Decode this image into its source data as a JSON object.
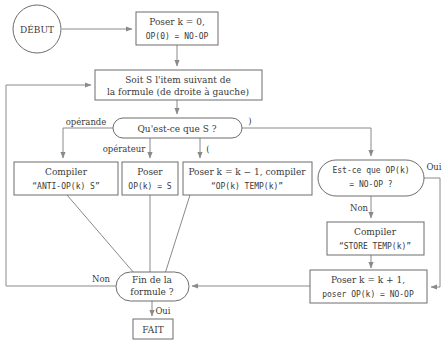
{
  "diagram": {
    "language": "fr",
    "colors": {
      "background": "#ffffff",
      "stroke": "#6d6d6d",
      "edge": "#8a8a8a",
      "text": "#3a3a3a"
    },
    "nodes": {
      "start": {
        "label": "DÉBUT",
        "shape": "circle"
      },
      "init": {
        "line1": "Poser k = 0,",
        "line2": "OP(0) = NO-OP",
        "shape": "rect"
      },
      "next_item": {
        "line1": "Soit S l'item suivant de",
        "line2": "la formule (de droite à gauche)",
        "shape": "rect"
      },
      "what_is_s": {
        "label": "Qu'est-ce que S ?",
        "shape": "stadium"
      },
      "compile_anti": {
        "line1": "Compiler",
        "line2": "“ANTI-OP(k)  S”",
        "shape": "rect"
      },
      "set_op": {
        "line1": "Poser",
        "line2": "OP(k) = S",
        "shape": "rect"
      },
      "dec_k": {
        "line1": "Poser k = k − 1, compiler",
        "line2": "“OP(k)  TEMP(k)”",
        "shape": "rect"
      },
      "is_noop": {
        "line1": "Est-ce que OP(k)",
        "line2": "= NO-OP ?",
        "shape": "stadium"
      },
      "compile_store": {
        "line1": "Compiler",
        "line2": "“STORE TEMP(k)”",
        "shape": "rect"
      },
      "inc_k": {
        "line1": "Poser k = k + 1,",
        "line2": "poser OP(k) = NO-OP",
        "shape": "rect"
      },
      "end_formula": {
        "line1": "Fin de la",
        "line2": "formule ?",
        "shape": "stadium"
      },
      "done": {
        "label": "FAIT",
        "shape": "rect"
      }
    },
    "edge_labels": {
      "operande": "opérande",
      "operateur": "opérateur",
      "open_paren": "(",
      "close_paren": ")",
      "oui_right": "Oui",
      "non_right": "Non",
      "non_left": "Non",
      "oui_bottom": "Oui"
    }
  }
}
